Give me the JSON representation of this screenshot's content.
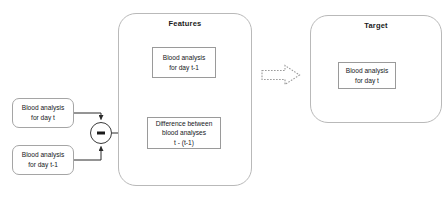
{
  "diagram": {
    "panels": {
      "features": {
        "title": "Features"
      },
      "target": {
        "title": "Target"
      }
    },
    "nodes": {
      "source_day_t": {
        "line1": "Blood analysis",
        "line2": "for day t"
      },
      "source_day_t_minus_1": {
        "line1": "Blood analysis",
        "line2": "for day t-1"
      },
      "feature_day_t_minus_1": {
        "line1": "Blood analysis",
        "line2": "for day t-1"
      },
      "feature_difference": {
        "line1": "Difference between",
        "line2": "blood analyses",
        "line3": "t - (t-1)"
      },
      "target_day_t": {
        "line1": "Blood analysis",
        "line2": "for day t"
      }
    },
    "operator": {
      "name": "subtraction",
      "symbol": "−"
    },
    "connectors": [
      {
        "from": "source_day_t",
        "to": "subtraction-operator",
        "style": "solid",
        "arrow": true
      },
      {
        "from": "source_day_t_minus_1",
        "to": "subtraction-operator",
        "style": "solid",
        "arrow": true
      },
      {
        "from": "subtraction-operator",
        "to": "feature_difference",
        "style": "solid",
        "arrow": true
      },
      {
        "from": "features",
        "to": "target",
        "style": "dotted",
        "arrow": true
      }
    ],
    "colors": {
      "background": "#ffffff",
      "panel_border": "#b9b9b9",
      "node_border": "#9a9a9a",
      "wire": "#2b2b2b",
      "dotted_arrow": "#9a9a9a",
      "text": "#15171a"
    }
  }
}
